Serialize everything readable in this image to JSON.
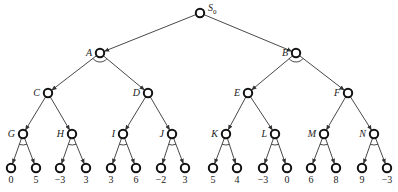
{
  "diagram": {
    "type": "and-or game tree",
    "root": {
      "id": "S0",
      "label": "S",
      "subscript": "0"
    },
    "nodes": [
      {
        "id": "S0",
        "label": "S0",
        "x": 200,
        "y": 13
      },
      {
        "id": "A",
        "label": "A",
        "x": 100,
        "y": 53,
        "and_arc": true
      },
      {
        "id": "B",
        "label": "B",
        "x": 296,
        "y": 53,
        "and_arc": true
      },
      {
        "id": "C",
        "label": "C",
        "x": 48,
        "y": 93
      },
      {
        "id": "D",
        "label": "D",
        "x": 148,
        "y": 93
      },
      {
        "id": "E",
        "label": "E",
        "x": 248,
        "y": 93
      },
      {
        "id": "F",
        "label": "F",
        "x": 348,
        "y": 93
      },
      {
        "id": "G",
        "label": "G",
        "x": 23,
        "y": 134,
        "and_arc": true
      },
      {
        "id": "H",
        "label": "H",
        "x": 72,
        "y": 134,
        "and_arc": true
      },
      {
        "id": "I",
        "label": "I",
        "x": 123,
        "y": 134,
        "and_arc": true
      },
      {
        "id": "J",
        "label": "J",
        "x": 172,
        "y": 134,
        "and_arc": true
      },
      {
        "id": "K",
        "label": "K",
        "x": 226,
        "y": 134,
        "and_arc": true
      },
      {
        "id": "L",
        "label": "L",
        "x": 275,
        "y": 134,
        "and_arc": true
      },
      {
        "id": "M",
        "label": "M",
        "x": 324,
        "y": 134,
        "and_arc": true
      },
      {
        "id": "N",
        "label": "N",
        "x": 374,
        "y": 134,
        "and_arc": true
      }
    ],
    "leaves": [
      {
        "parent": "G",
        "value": "0",
        "x": 11,
        "y": 168
      },
      {
        "parent": "G",
        "value": "5",
        "x": 36,
        "y": 168
      },
      {
        "parent": "H",
        "value": "−3",
        "x": 60,
        "y": 168
      },
      {
        "parent": "H",
        "value": "3",
        "x": 86,
        "y": 168
      },
      {
        "parent": "I",
        "value": "3",
        "x": 111,
        "y": 168
      },
      {
        "parent": "I",
        "value": "6",
        "x": 136,
        "y": 168
      },
      {
        "parent": "J",
        "value": "−2",
        "x": 161,
        "y": 168
      },
      {
        "parent": "J",
        "value": "3",
        "x": 185,
        "y": 168
      },
      {
        "parent": "K",
        "value": "5",
        "x": 213,
        "y": 168
      },
      {
        "parent": "K",
        "value": "4",
        "x": 237,
        "y": 168
      },
      {
        "parent": "L",
        "value": "−3",
        "x": 263,
        "y": 168
      },
      {
        "parent": "L",
        "value": "0",
        "x": 287,
        "y": 168
      },
      {
        "parent": "M",
        "value": "6",
        "x": 311,
        "y": 168
      },
      {
        "parent": "M",
        "value": "8",
        "x": 336,
        "y": 168
      },
      {
        "parent": "N",
        "value": "9",
        "x": 362,
        "y": 168
      },
      {
        "parent": "N",
        "value": "−3",
        "x": 387,
        "y": 168
      }
    ],
    "edges": [
      [
        "S0",
        "A"
      ],
      [
        "S0",
        "B"
      ],
      [
        "A",
        "C"
      ],
      [
        "A",
        "D"
      ],
      [
        "B",
        "E"
      ],
      [
        "B",
        "F"
      ],
      [
        "C",
        "G"
      ],
      [
        "C",
        "H"
      ],
      [
        "D",
        "I"
      ],
      [
        "D",
        "J"
      ],
      [
        "E",
        "K"
      ],
      [
        "E",
        "L"
      ],
      [
        "F",
        "M"
      ],
      [
        "F",
        "N"
      ]
    ]
  }
}
